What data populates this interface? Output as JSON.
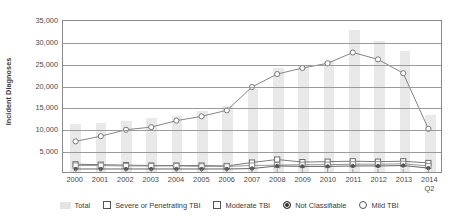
{
  "chart_data": {
    "type": "bar",
    "title": "",
    "xlabel": "",
    "ylabel": "Incident Diagnoses",
    "categories": [
      "2000",
      "2001",
      "2002",
      "2003",
      "2004",
      "2005",
      "2006",
      "2007",
      "2008",
      "2009",
      "2010",
      "2011",
      "2012",
      "2013",
      "2014"
    ],
    "category_sublabels": [
      "",
      "",
      "",
      "",
      "",
      "",
      "",
      "",
      "",
      "",
      "",
      "",
      "",
      "",
      "Q2"
    ],
    "ylim": [
      0,
      35000
    ],
    "ytick_values": [
      5000,
      10000,
      15000,
      20000,
      25000,
      30000,
      35000
    ],
    "ytick_labels": [
      "5,000",
      "10,000",
      "15,000",
      "20,000",
      "25,000",
      "30,000",
      "35,000"
    ],
    "grid": true,
    "legend_position": "bottom",
    "series": [
      {
        "name": "Total",
        "render": "bar",
        "color": "#e9e9e9",
        "values": [
          10900,
          11100,
          11600,
          12400,
          12700,
          13900,
          15200,
          19000,
          23700,
          24400,
          25400,
          32500,
          29900,
          27700,
          13100
        ]
      },
      {
        "name": "Severe or Penetrating TBI",
        "render": "line-square",
        "color": "#6b6b6b",
        "values": [
          1800,
          1700,
          1600,
          1500,
          1500,
          1500,
          1400,
          2200,
          2900,
          2300,
          2400,
          2500,
          2400,
          2500,
          2100
        ]
      },
      {
        "name": "Moderate TBI",
        "render": "line-square",
        "color": "#8a8a8a",
        "values": [
          1500,
          1500,
          1400,
          1400,
          1400,
          1300,
          1300,
          1500,
          1600,
          1700,
          1700,
          1800,
          1800,
          1900,
          1400
        ]
      },
      {
        "name": "Not Classifiable",
        "render": "line-dot",
        "color": "#555555",
        "values": [
          700,
          700,
          700,
          700,
          700,
          700,
          700,
          800,
          1400,
          1300,
          1300,
          1400,
          1400,
          1500,
          900
        ]
      },
      {
        "name": "Mild TBI",
        "render": "line-circle",
        "color": "#777777",
        "values": [
          7100,
          8300,
          9800,
          10400,
          11900,
          12900,
          14300,
          19700,
          22700,
          24100,
          25200,
          27700,
          26100,
          22900,
          10000
        ]
      }
    ],
    "legend": [
      {
        "label": "Total",
        "marker": "bar-swatch"
      },
      {
        "label": "Severe or Penetrating TBI",
        "marker": "square"
      },
      {
        "label": "Moderate TBI",
        "marker": "square"
      },
      {
        "label": "Not Classifiable",
        "marker": "filled-circle"
      },
      {
        "label": "Mild TBI",
        "marker": "open-circle"
      }
    ]
  }
}
